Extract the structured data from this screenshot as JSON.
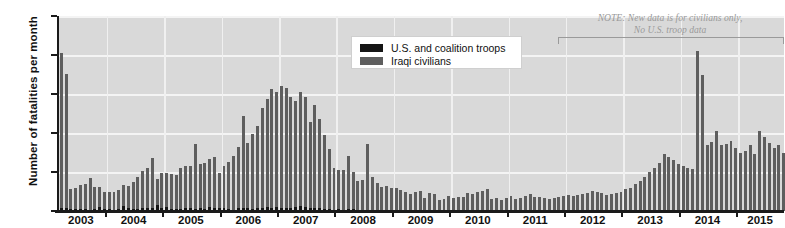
{
  "chart_data": {
    "type": "bar",
    "title": "",
    "xlabel": "",
    "ylabel": "Number of fatalities per month",
    "ylim": [
      0,
      5000
    ],
    "yticks": [
      "0",
      "1,000",
      "2,000",
      "3,000",
      "4,000",
      "5,000"
    ],
    "ytick_values": [
      0,
      1000,
      2000,
      3000,
      4000,
      5000
    ],
    "grid": true,
    "legend_position": "top-center",
    "categories": [
      "2003-03",
      "2003-04",
      "2003-05",
      "2003-06",
      "2003-07",
      "2003-08",
      "2003-09",
      "2003-10",
      "2003-11",
      "2003-12",
      "2004-01",
      "2004-02",
      "2004-03",
      "2004-04",
      "2004-05",
      "2004-06",
      "2004-07",
      "2004-08",
      "2004-09",
      "2004-10",
      "2004-11",
      "2004-12",
      "2005-01",
      "2005-02",
      "2005-03",
      "2005-04",
      "2005-05",
      "2005-06",
      "2005-07",
      "2005-08",
      "2005-09",
      "2005-10",
      "2005-11",
      "2005-12",
      "2006-01",
      "2006-02",
      "2006-03",
      "2006-04",
      "2006-05",
      "2006-06",
      "2006-07",
      "2006-08",
      "2006-09",
      "2006-10",
      "2006-11",
      "2006-12",
      "2007-01",
      "2007-02",
      "2007-03",
      "2007-04",
      "2007-05",
      "2007-06",
      "2007-07",
      "2007-08",
      "2007-09",
      "2007-10",
      "2007-11",
      "2007-12",
      "2008-01",
      "2008-02",
      "2008-03",
      "2008-04",
      "2008-05",
      "2008-06",
      "2008-07",
      "2008-08",
      "2008-09",
      "2008-10",
      "2008-11",
      "2008-12",
      "2009-01",
      "2009-02",
      "2009-03",
      "2009-04",
      "2009-05",
      "2009-06",
      "2009-07",
      "2009-08",
      "2009-09",
      "2009-10",
      "2009-11",
      "2009-12",
      "2010-01",
      "2010-02",
      "2010-03",
      "2010-04",
      "2010-05",
      "2010-06",
      "2010-07",
      "2010-08",
      "2010-09",
      "2010-10",
      "2010-11",
      "2010-12",
      "2011-01",
      "2011-02",
      "2011-03",
      "2011-04",
      "2011-05",
      "2011-06",
      "2011-07",
      "2011-08",
      "2011-09",
      "2011-10",
      "2011-11",
      "2011-12",
      "2012-01",
      "2012-02",
      "2012-03",
      "2012-04",
      "2012-05",
      "2012-06",
      "2012-07",
      "2012-08",
      "2012-09",
      "2012-10",
      "2012-11",
      "2012-12",
      "2013-01",
      "2013-02",
      "2013-03",
      "2013-04",
      "2013-05",
      "2013-06",
      "2013-07",
      "2013-08",
      "2013-09",
      "2013-10",
      "2013-11",
      "2013-12",
      "2014-01",
      "2014-02",
      "2014-03",
      "2014-04",
      "2014-05",
      "2014-06",
      "2014-07",
      "2014-08",
      "2014-09",
      "2014-10",
      "2014-11",
      "2014-12",
      "2015-01",
      "2015-02",
      "2015-03",
      "2015-04",
      "2015-05",
      "2015-06",
      "2015-07",
      "2015-08",
      "2015-09",
      "2015-10"
    ],
    "series": [
      {
        "name": "Iraqi civilians",
        "color": "#5e5e5e",
        "values": [
          3970,
          3430,
          520,
          560,
          600,
          640,
          810,
          560,
          500,
          440,
          450,
          470,
          490,
          530,
          560,
          700,
          800,
          950,
          1020,
          1290,
          670,
          890,
          870,
          900,
          880,
          1050,
          1060,
          1060,
          1660,
          1120,
          1180,
          1240,
          1290,
          900,
          1080,
          1190,
          1370,
          1560,
          2350,
          1690,
          1920,
          2100,
          2570,
          2760,
          3060,
          2940,
          3110,
          3080,
          2850,
          2700,
          2930,
          2820,
          2200,
          2630,
          2300,
          1900,
          1560,
          1080,
          1020,
          1010,
          1360,
          940,
          760,
          760,
          1700,
          840,
          680,
          600,
          620,
          580,
          560,
          530,
          480,
          420,
          460,
          500,
          320,
          460,
          420,
          280,
          300,
          380,
          320,
          360,
          340,
          450,
          430,
          490,
          510,
          560,
          300,
          330,
          290,
          340,
          380,
          310,
          330,
          370,
          430,
          360,
          350,
          320,
          300,
          330,
          350,
          370,
          420,
          380,
          400,
          430,
          460,
          520,
          480,
          450,
          410,
          440,
          470,
          500,
          560,
          600,
          680,
          760,
          880,
          1000,
          1100,
          1230,
          1450,
          1380,
          1320,
          1200,
          1160,
          1100,
          1070,
          4100,
          3500,
          1680,
          1780,
          2060,
          1680,
          1720,
          1800,
          1620,
          1480,
          1550,
          1700,
          1450,
          2050,
          1900,
          1750,
          1620,
          1700,
          1480
        ]
      },
      {
        "name": "U.S. and coalition troops",
        "color": "#151515",
        "values": [
          80,
          80,
          45,
          40,
          55,
          45,
          35,
          45,
          110,
          45,
          50,
          25,
          55,
          140,
          85,
          55,
          60,
          80,
          90,
          70,
          145,
          75,
          110,
          60,
          40,
          55,
          90,
          85,
          60,
          90,
          55,
          100,
          90,
          70,
          70,
          60,
          35,
          80,
          80,
          65,
          50,
          70,
          80,
          110,
          75,
          115,
          85,
          85,
          85,
          110,
          130,
          105,
          85,
          90,
          70,
          40,
          40,
          25,
          40,
          30,
          40,
          55,
          20,
          30,
          15,
          25,
          30,
          20,
          20,
          15,
          25,
          20,
          10,
          20,
          25,
          20,
          10,
          10,
          10,
          10,
          20,
          5,
          5,
          10,
          10,
          5,
          10,
          10,
          5,
          10,
          5,
          5,
          5,
          5,
          10,
          5,
          5,
          5,
          5,
          10,
          20,
          5,
          5,
          5,
          5,
          5,
          0,
          0,
          0,
          0,
          0,
          0,
          0,
          0,
          0,
          0,
          0,
          0,
          0,
          0,
          0,
          0,
          0,
          0,
          0,
          0,
          0,
          0,
          0,
          0,
          0,
          0,
          0,
          0,
          0,
          0,
          0,
          0,
          0,
          0,
          0,
          0,
          0,
          0,
          0,
          0,
          0,
          0,
          0,
          0,
          0,
          0
        ]
      }
    ],
    "xtick_labels": [
      "2003",
      "2004",
      "2005",
      "2006",
      "2007",
      "2008",
      "2009",
      "2010",
      "2011",
      "2012",
      "2013",
      "2014",
      "2015"
    ],
    "annotations": [
      {
        "name": "new-data-note",
        "line1": "NOTE: New data is for civilians only,",
        "line2": "No U.S. troop data",
        "color": "#9a9a9a"
      }
    ]
  },
  "legend": {
    "items": [
      {
        "label": "U.S. and coalition troops",
        "color": "#151515"
      },
      {
        "label": "Iraqi civilians",
        "color": "#5e5e5e"
      }
    ]
  },
  "colors": {
    "plot_background": "#d9d9d9",
    "gridline": "#f4f4f4",
    "axis": "#1a1a1a",
    "civilian_bar": "#5e5e5e",
    "troop_bar": "#151515",
    "note_text": "#9a9a9a"
  }
}
